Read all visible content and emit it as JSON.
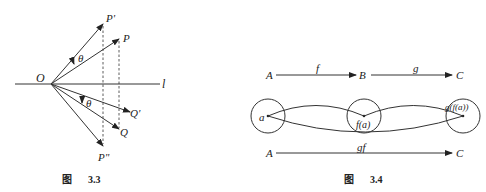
{
  "figure_33": {
    "caption_prefix": "图",
    "caption_number": "3.3",
    "labels": {
      "O": "O",
      "l": "l",
      "P": "P",
      "P_prime": "P'",
      "P_double": "P\"",
      "Q": "Q",
      "Q_prime": "Q'",
      "theta_upper": "θ",
      "theta_lower": "θ"
    }
  },
  "figure_34": {
    "caption_prefix": "图",
    "caption_number": "3.4",
    "top_row": {
      "A": "A",
      "B": "B",
      "C": "C",
      "f": "f",
      "g": "g"
    },
    "circles": {
      "a": "a",
      "fa": "f(a)",
      "gfa": "g(f(a))"
    },
    "bottom_row": {
      "A": "A",
      "C": "C",
      "gf": "gf"
    }
  }
}
